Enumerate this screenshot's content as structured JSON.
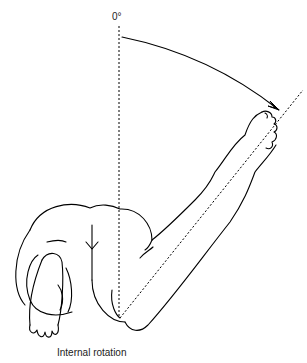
{
  "figure": {
    "angle_label": "0°",
    "caption": "Internal rotation",
    "reference_line": "vertical-0-degree",
    "movement_arrow": "arc-from-vertical-to-forearm",
    "ink_color": "#000000",
    "background_color": "#ffffff"
  }
}
